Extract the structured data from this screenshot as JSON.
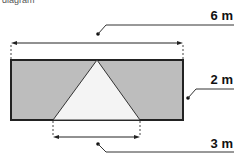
{
  "diagram": {
    "header_fragment": "diagram",
    "labels": {
      "width": "6 m",
      "height": "2 m",
      "base": "3 m"
    },
    "colors": {
      "rect_fill": "#bdbdbd",
      "triangle_fill": "#f4f4f4",
      "stroke": "#222222"
    }
  }
}
